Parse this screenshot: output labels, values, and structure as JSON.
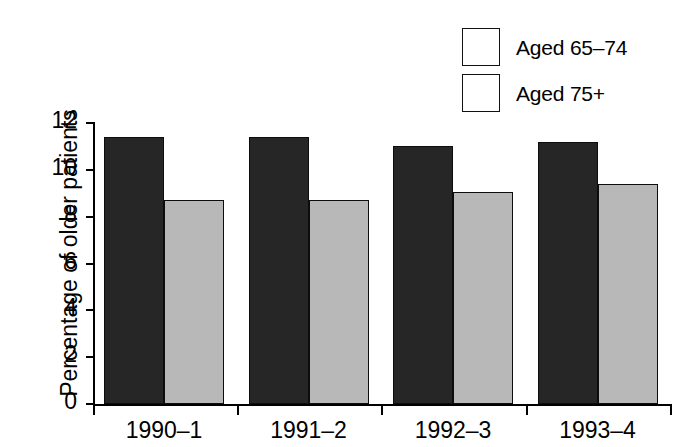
{
  "chart_data": {
    "type": "bar",
    "title": "",
    "xlabel": "",
    "ylabel": "Percentage of older patients",
    "categories": [
      "1990–1",
      "1991–2",
      "1992–3",
      "1993–4"
    ],
    "series": [
      {
        "name": "Aged 65–74",
        "values": [
          11.4,
          11.4,
          11.0,
          11.2
        ],
        "color": "#262626"
      },
      {
        "name": "Aged 75+",
        "values": [
          8.7,
          8.7,
          9.05,
          9.4
        ],
        "color": "#b8b8b8"
      }
    ],
    "ylim": [
      0,
      12
    ],
    "ytick_labels": [
      "12",
      "10",
      "8",
      "6",
      "4",
      "2",
      "0"
    ],
    "ytick_values": [
      12,
      10,
      8,
      6,
      4,
      2,
      0
    ],
    "grid": false,
    "legend_position": "top-right"
  },
  "legend": {
    "items": [
      {
        "label": "Aged 65–74",
        "color": "#262626"
      },
      {
        "label": "Aged 75+",
        "color": "#b8b8b8"
      }
    ]
  }
}
